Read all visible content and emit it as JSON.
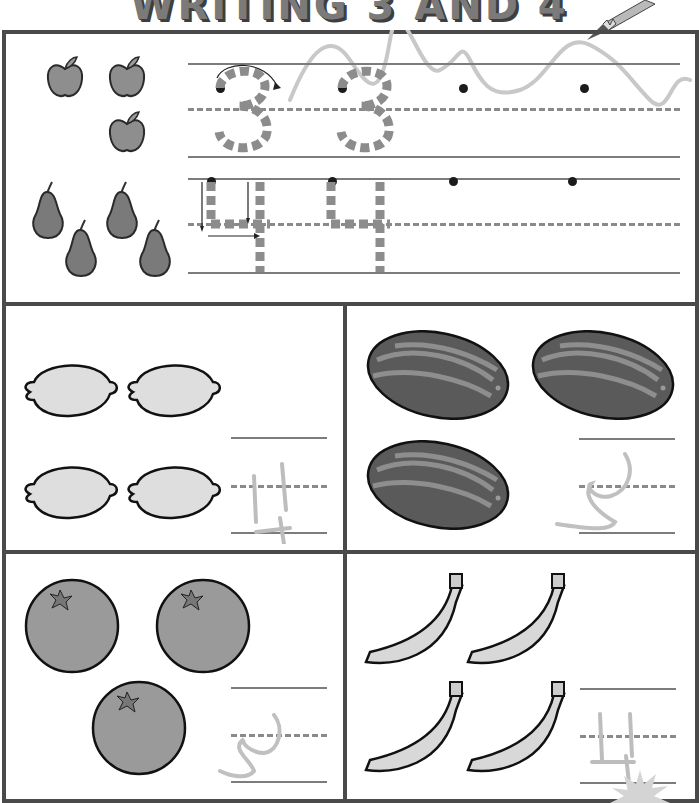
{
  "worksheet": {
    "title": "WRITING 3 AND 4",
    "colors": {
      "frame": "#4a4a4a",
      "line": "#7c7c7c",
      "trace": "#8c8c8c",
      "fruit_dark": "#6e6e6e",
      "fruit_mid": "#9a9a9a",
      "fruit_light": "#dedede"
    },
    "tracing_panel": {
      "rows": [
        {
          "digit": "3",
          "fruit": "apple",
          "count": 3,
          "traced_copies": 2,
          "start_dots": 4
        },
        {
          "digit": "4",
          "fruit": "pear",
          "count": 4,
          "traced_copies": 2,
          "start_dots": 4
        }
      ]
    },
    "count_panels": [
      {
        "id": "lemons",
        "fruit": "lemon",
        "count": 4,
        "written_answer": "4"
      },
      {
        "id": "watermelons",
        "fruit": "watermelon",
        "count": 3,
        "written_answer": "3"
      },
      {
        "id": "oranges",
        "fruit": "orange",
        "count": 3,
        "written_answer": "3"
      },
      {
        "id": "bananas",
        "fruit": "banana",
        "count": 4,
        "written_answer": "4"
      }
    ]
  }
}
